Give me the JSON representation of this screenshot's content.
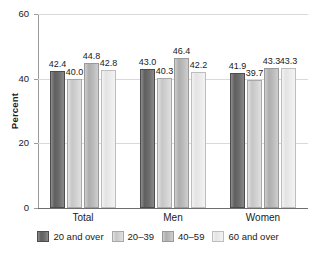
{
  "chart_data": {
    "type": "bar",
    "title": "",
    "subtitle": "",
    "xlabel": "",
    "ylabel": "Percent",
    "ylim": [
      0,
      60
    ],
    "yticks": [
      0,
      20,
      40,
      60
    ],
    "ytick_labels": [
      "0",
      "20",
      "40",
      "60"
    ],
    "grid": true,
    "grid_axis": "y",
    "legend_position": "bottom",
    "categories": [
      "Total",
      "Men",
      "Women"
    ],
    "series": [
      {
        "name": "20 and over",
        "color": "#6d6d6d",
        "values": [
          42.4,
          43.0,
          41.9
        ],
        "labels": [
          "42.4",
          "43.0",
          "41.9"
        ]
      },
      {
        "name": "20–39",
        "color": "#d2d2d2",
        "values": [
          40.0,
          40.3,
          39.7
        ],
        "labels": [
          "40.0",
          "40.3",
          "39.7"
        ]
      },
      {
        "name": "40–59",
        "color": "#bcbcbc",
        "values": [
          44.8,
          46.4,
          43.3
        ],
        "labels": [
          "44.8",
          "46.4",
          "43.3"
        ]
      },
      {
        "name": "60 and over",
        "color": "#ebebeb",
        "values": [
          42.8,
          42.2,
          43.3
        ],
        "labels": [
          "42.8",
          "42.2",
          "43.3"
        ]
      }
    ]
  },
  "legend": {
    "items": [
      {
        "label": "20 and over"
      },
      {
        "label": "20–39"
      },
      {
        "label": "40–59"
      },
      {
        "label": "60 and over"
      }
    ]
  }
}
